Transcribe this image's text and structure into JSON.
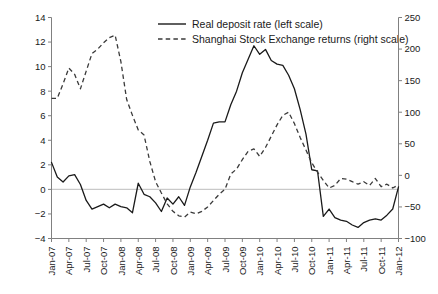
{
  "chart_data": {
    "type": "line",
    "title": "",
    "subtitle": "",
    "xlabel": "",
    "ylabel": "",
    "grid": false,
    "legend_position": "top-center",
    "axes": {
      "left": {
        "label": "Real deposit rate (left scale)",
        "ylim": [
          -4,
          14
        ],
        "ticks": [
          -4,
          -2,
          0,
          2,
          4,
          6,
          8,
          10,
          12,
          14
        ],
        "tick_labels": [
          "-4",
          "-2",
          "0",
          "2",
          "4",
          "6",
          "8",
          "10",
          "12",
          "14"
        ]
      },
      "right": {
        "label": "Shanghai Stock Exchange returns (right scale)",
        "ylim": [
          -100,
          250
        ],
        "ticks": [
          -100,
          -50,
          0,
          50,
          100,
          150,
          200,
          250
        ],
        "tick_labels": [
          "-100",
          "-50",
          "0",
          "50",
          "100",
          "150",
          "200",
          "250"
        ]
      },
      "x": {
        "tick_labels": [
          "Jan-07",
          "Apr-07",
          "Jul-07",
          "Oct-07",
          "Jan-08",
          "Apr-08",
          "Jul-08",
          "Oct-08",
          "Jan-09",
          "Apr-09",
          "Jul-09",
          "Oct-09",
          "Jan-10",
          "Apr-10",
          "Jul-10",
          "Oct-10",
          "Jan-11",
          "Apr-11",
          "Jul-11",
          "Oct-11",
          "Jan-12"
        ],
        "tick_indices": [
          0,
          3,
          6,
          9,
          12,
          15,
          18,
          21,
          24,
          27,
          30,
          33,
          36,
          39,
          42,
          45,
          48,
          51,
          54,
          57,
          60
        ],
        "n_points": 61
      }
    },
    "legend": [
      {
        "name": "Real deposit rate (left scale)",
        "style": "solid",
        "axis": "left"
      },
      {
        "name": "Shanghai Stock Exchange returns (right scale)",
        "style": "dashed",
        "axis": "right"
      }
    ],
    "series": [
      {
        "name": "Real deposit rate (left scale)",
        "style": "solid",
        "axis": "left",
        "values": [
          2.2,
          1.0,
          0.6,
          1.1,
          1.2,
          0.4,
          -0.9,
          -1.6,
          -1.4,
          -1.2,
          -1.5,
          -1.2,
          -1.4,
          -1.5,
          -1.9,
          0.5,
          -0.4,
          -0.6,
          -1.1,
          -1.8,
          -0.7,
          -1.2,
          -0.6,
          -1.3,
          0.2,
          1.4,
          2.7,
          4.0,
          5.4,
          5.5,
          5.5,
          6.9,
          8.0,
          9.5,
          10.6,
          11.7,
          11.0,
          11.4,
          10.5,
          10.2,
          10.1,
          9.3,
          8.2,
          6.5,
          4.5,
          1.6,
          1.5,
          -2.2,
          -1.6,
          -2.3,
          -2.5,
          -2.6,
          -2.9,
          -3.1,
          -2.7,
          -2.5,
          -2.4,
          -2.5,
          -2.1,
          -1.6,
          0.2
        ]
      },
      {
        "name": "Shanghai Stock Exchange returns (right scale)",
        "style": "dashed",
        "axis": "right",
        "values": [
          122,
          122,
          145,
          170,
          160,
          137,
          165,
          193,
          200,
          210,
          218,
          222,
          180,
          120,
          95,
          72,
          64,
          22,
          -10,
          -28,
          -45,
          -57,
          -64,
          -66,
          -58,
          -61,
          -57,
          -50,
          -40,
          -30,
          -22,
          2,
          10,
          25,
          38,
          42,
          30,
          44,
          62,
          80,
          95,
          100,
          82,
          60,
          40,
          20,
          5,
          -8,
          -20,
          -16,
          -5,
          -6,
          -10,
          -14,
          -10,
          -16,
          -5,
          -18,
          -14,
          -20,
          -15
        ]
      }
    ],
    "secondary_series_detail": {
      "note_solid": "Real deposit rate, percent; peaks ~11.7 around Oct-09, trough ~-3.1 around Jul-10, ends ~5 at Jan-12",
      "note_dashed": "SSE returns, percent; peaks ~222 around Oct-07, trough ~-66 around Oct-08, ends ~-15 at Jan-12"
    }
  },
  "legend_display": {
    "entry1": "Real deposit rate (left scale)",
    "entry2": "Shanghai Stock Exchange returns (right scale)"
  }
}
